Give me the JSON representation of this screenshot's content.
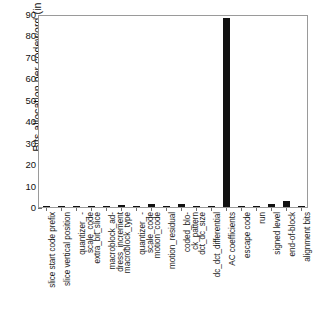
{
  "chart_data": {
    "type": "bar",
    "title": "",
    "xlabel": "",
    "ylabel": "Bits allocation per codeword (in %)",
    "ylim": [
      0,
      90
    ],
    "yticks": [
      0,
      10,
      20,
      30,
      40,
      50,
      60,
      70,
      80,
      90
    ],
    "grid": false,
    "legend": null,
    "bar_color": "#111111",
    "categories": [
      "slice start code prefix",
      "slice vertical position",
      "quantizer_ -\nscale_code",
      "extra_bit_slice",
      "macroblock_ad-\ndress_increment",
      "macroblock_type",
      "quantizer_ -\nscale_code",
      "motion_code",
      "motion_residual",
      "coded_blo-\nck_pattern",
      "dct_dc_size",
      "dc_dct_differential",
      "AC coefficients",
      "escape code",
      "run",
      "signed level",
      "end-of-block",
      "alignment bits"
    ],
    "values": [
      0.5,
      0.2,
      0.2,
      0.1,
      0.4,
      0.8,
      0.5,
      1.3,
      0.1,
      1.3,
      0.3,
      0.2,
      88.0,
      0.5,
      0.6,
      1.2,
      2.6,
      0.1
    ]
  },
  "axis": {
    "y_tick_labels": [
      "0",
      "10",
      "20",
      "30",
      "40",
      "50",
      "60",
      "70",
      "80",
      "90"
    ]
  }
}
